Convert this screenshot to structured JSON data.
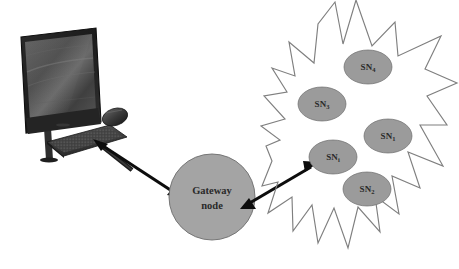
{
  "diagram": {
    "background_color": "#ffffff",
    "colors": {
      "node_fill": "#9b9b9b",
      "gateway_fill": "#a4a4a4",
      "node_stroke": "#6e6e6e",
      "star_outline": "#7f7f7f",
      "arrow": "#0d0d0d",
      "label_text": "#2a2a2a"
    }
  },
  "workstation": {
    "name": "all-in-one-computer",
    "description": "desktop computer with monitor, keyboard and mouse"
  },
  "gateway": {
    "line1": "Gateway",
    "line2": "node"
  },
  "sensor_nodes": [
    {
      "id": "sn4",
      "base": "SN",
      "subscript": "4",
      "cx": 368,
      "cy": 67,
      "rx": 24,
      "ry": 17
    },
    {
      "id": "sn3",
      "base": "SN",
      "subscript": "3",
      "cx": 322,
      "cy": 104,
      "rx": 24,
      "ry": 17
    },
    {
      "id": "sn1",
      "base": "SN",
      "subscript": "1",
      "cx": 388,
      "cy": 136,
      "rx": 24,
      "ry": 17
    },
    {
      "id": "sni",
      "base": "SN",
      "subscript": "i",
      "cx": 333,
      "cy": 157,
      "rx": 24,
      "ry": 17
    },
    {
      "id": "sn2",
      "base": "SN",
      "subscript": "2",
      "cx": 367,
      "cy": 189,
      "rx": 24,
      "ry": 17
    }
  ],
  "connections": [
    {
      "id": "pc-gateway",
      "from": "all-in-one-computer",
      "to": "gateway-node",
      "style": "double-headed-arrow"
    },
    {
      "id": "gateway-sni",
      "from": "gateway-node",
      "to": "sn-i",
      "style": "double-headed-arrow"
    }
  ]
}
